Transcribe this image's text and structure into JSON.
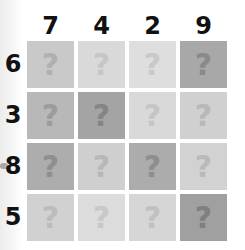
{
  "puzzle": {
    "column_labels": [
      "7",
      "4",
      "2",
      "9"
    ],
    "row_labels": [
      "6",
      "3",
      "8",
      "5"
    ],
    "cell_symbol": "?",
    "cell_icon": "question-mark-icon",
    "cells": [
      [
        {
          "bg": "#c9c9c9",
          "fg": "#b0b0b0"
        },
        {
          "bg": "#d9d9d9",
          "fg": "#c6c6c6"
        },
        {
          "bg": "#dedede",
          "fg": "#c9c9c9"
        },
        {
          "bg": "#a8a8a8",
          "fg": "#8a8a8a"
        }
      ],
      [
        {
          "bg": "#b8b8b8",
          "fg": "#9c9c9c"
        },
        {
          "bg": "#a4a4a4",
          "fg": "#858585"
        },
        {
          "bg": "#d9d9d9",
          "fg": "#c5c5c5"
        },
        {
          "bg": "#d0d0d0",
          "fg": "#b8b8b8"
        }
      ],
      [
        {
          "bg": "#adadad",
          "fg": "#8f8f8f"
        },
        {
          "bg": "#cfcfcf",
          "fg": "#b8b8b8"
        },
        {
          "bg": "#acacac",
          "fg": "#8e8e8e"
        },
        {
          "bg": "#d2d2d2",
          "fg": "#bababa"
        }
      ],
      [
        {
          "bg": "#d1d1d1",
          "fg": "#bcbcbc"
        },
        {
          "bg": "#dcdcdc",
          "fg": "#c8c8c8"
        },
        {
          "bg": "#d6d6d6",
          "fg": "#c1c1c1"
        },
        {
          "bg": "#a0a0a0",
          "fg": "#7f7f7f"
        }
      ]
    ]
  },
  "layout": {
    "col_x": [
      27,
      78,
      129,
      180
    ],
    "row_y": [
      41,
      92,
      143,
      194
    ]
  }
}
